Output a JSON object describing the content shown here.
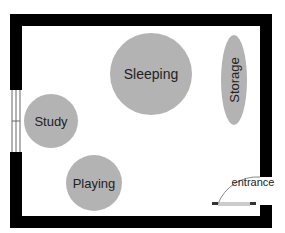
{
  "floorplan": {
    "zones": [
      {
        "id": "sleeping",
        "label": "Sleeping"
      },
      {
        "id": "storage",
        "label": "Storage"
      },
      {
        "id": "study",
        "label": "Study"
      },
      {
        "id": "playing",
        "label": "Playing"
      }
    ],
    "entrance": {
      "label": "entrance"
    },
    "colors": {
      "wall": "#000000",
      "zone_fill": "#b3b3b3",
      "background": "#ffffff"
    }
  }
}
